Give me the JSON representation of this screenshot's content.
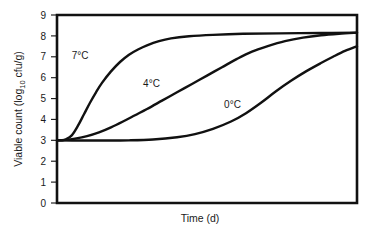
{
  "chart_data": {
    "type": "line",
    "title": "",
    "xlabel": "Time (d)",
    "ylabel": "Viable count (log10 cfu/g)",
    "ylabel_parts": {
      "before": "Viable count (log",
      "subscript": "10",
      "after": " cfu/g)"
    },
    "xlim": [
      0,
      100
    ],
    "ylim": [
      0,
      9
    ],
    "yticks": [
      0,
      1,
      2,
      3,
      4,
      5,
      6,
      7,
      8,
      9
    ],
    "ytick_labels": [
      "0",
      "1",
      "2",
      "3",
      "4",
      "5",
      "6",
      "7",
      "8",
      "9"
    ],
    "xticks": [],
    "xtick_labels": [],
    "grid": false,
    "legend": "inline-annotations",
    "series": [
      {
        "name": "7°C",
        "label": "7°C",
        "color": "#111111",
        "label_x": 7.7,
        "label_y": 6.9,
        "x": [
          0,
          1.5,
          3,
          5,
          7,
          9,
          11,
          13,
          15,
          18,
          21,
          24,
          27,
          30,
          34,
          38,
          44,
          52,
          62,
          74,
          88,
          100
        ],
        "y": [
          3.0,
          3.0,
          3.05,
          3.25,
          3.7,
          4.25,
          4.8,
          5.3,
          5.75,
          6.3,
          6.75,
          7.1,
          7.35,
          7.55,
          7.75,
          7.88,
          7.98,
          8.05,
          8.1,
          8.12,
          8.14,
          8.15
        ]
      },
      {
        "name": "4°C",
        "label": "4°C",
        "color": "#111111",
        "label_x": 31.5,
        "label_y": 5.55,
        "x": [
          0,
          3,
          6,
          10,
          14,
          18,
          22,
          26,
          30,
          35,
          40,
          45,
          50,
          55,
          60,
          65,
          70,
          76,
          82,
          88,
          94,
          100
        ],
        "y": [
          3.0,
          3.02,
          3.08,
          3.2,
          3.38,
          3.62,
          3.9,
          4.2,
          4.5,
          4.9,
          5.3,
          5.7,
          6.1,
          6.5,
          6.9,
          7.25,
          7.5,
          7.75,
          7.92,
          8.03,
          8.1,
          8.15
        ]
      },
      {
        "name": "0°C",
        "label": "0°C",
        "color": "#111111",
        "label_x": 58.5,
        "label_y": 4.55,
        "x": [
          0,
          8,
          16,
          24,
          32,
          40,
          46,
          52,
          58,
          63,
          68,
          73,
          78,
          83,
          88,
          92,
          96,
          100
        ],
        "y": [
          3.0,
          2.99,
          2.99,
          3.0,
          3.04,
          3.15,
          3.3,
          3.55,
          3.9,
          4.3,
          4.8,
          5.35,
          5.85,
          6.3,
          6.7,
          7.0,
          7.28,
          7.5
        ]
      }
    ]
  },
  "axes": {
    "y_title": "Viable count (log10 cfu/g)",
    "x_title": "Time (d)"
  },
  "colors": {
    "curve": "#111111",
    "frame": "#111111",
    "text": "#1a1a1a",
    "background": "#ffffff"
  }
}
